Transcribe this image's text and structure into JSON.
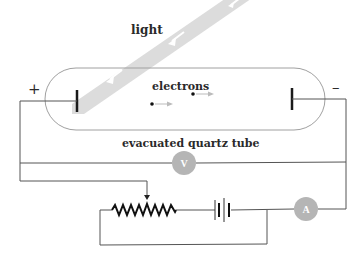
{
  "diagram": {
    "type": "photoelectric-effect-apparatus",
    "labels": {
      "light": "light",
      "electrons": "electrons",
      "tube": "evacuated quartz tube",
      "positive_terminal": "+",
      "negative_terminal": "–",
      "voltmeter": "V",
      "ammeter": "A"
    },
    "colors": {
      "wire": "#555555",
      "tube_outline": "#9a9a9a",
      "light_beam": "#d9d9d9",
      "meter_fill": "#b3b3b3",
      "electrode": "#1a1a1a",
      "electron_arrow": "#b8b8b8"
    },
    "components": [
      {
        "name": "light-beam",
        "description": "diagonal light beam with arrows pointing toward left electrode"
      },
      {
        "name": "evacuated-quartz-tube",
        "description": "capsule-shaped tube containing two electrodes"
      },
      {
        "name": "left-electrode",
        "polarity": "+"
      },
      {
        "name": "right-electrode",
        "polarity": "–"
      },
      {
        "name": "voltmeter",
        "symbol": "V"
      },
      {
        "name": "ammeter",
        "symbol": "A"
      },
      {
        "name": "rheostat",
        "description": "variable resistor with sliding contact"
      },
      {
        "name": "battery",
        "description": "DC source"
      }
    ]
  }
}
